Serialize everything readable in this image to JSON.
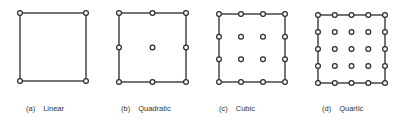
{
  "figure": {
    "elements": [
      {
        "tag": "(a)",
        "name": "Linear",
        "order": 1
      },
      {
        "tag": "(b)",
        "name": "Quadratic",
        "order": 2
      },
      {
        "tag": "(c)",
        "name": "Cubic",
        "order": 3
      },
      {
        "tag": "(d)",
        "name": "Quartic",
        "order": 4
      }
    ],
    "colors": {
      "stroke": "#2a2a2a",
      "node_fill": "#ffffff",
      "text": "#333333"
    }
  }
}
